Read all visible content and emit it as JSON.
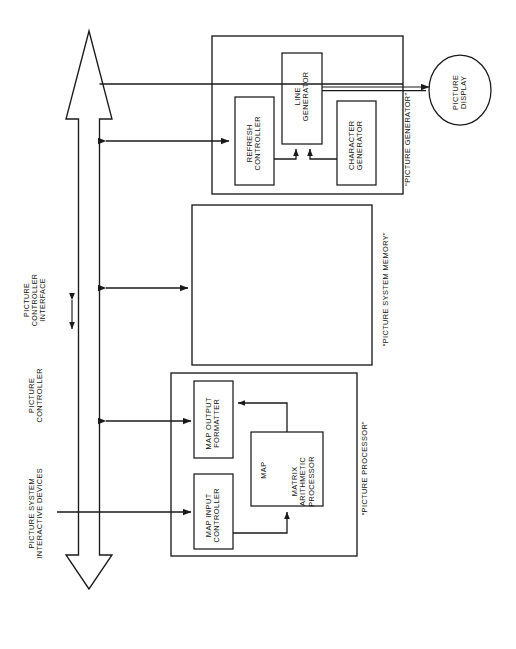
{
  "diagram": {
    "type": "block-diagram",
    "orientation": "rotated-90-ccw",
    "line_color": "#1a1a1a",
    "background": "#ffffff"
  },
  "side_labels": {
    "interactive_devices": "PICTURE SYSTEM\nINTERACTIVE DEVICES",
    "picture_controller": "PICTURE\nCONTROLLER",
    "controller_interface": "PICTURE\nCONTROLLER\nINTERFACE"
  },
  "groups": {
    "picture_generator": "“PICTURE GENERATOR”",
    "picture_system_memory": "“PICTURE SYSTEM MEMORY”",
    "picture_processor": "“PICTURE PROCESSOR”"
  },
  "blocks": {
    "line_generator": "LINE\nGENERATOR",
    "refresh_controller": "REFRESH\nCONTROLLER",
    "character_generator": "CHARACTER\nGENERATOR",
    "picture_display": "PICTURE\nDISPLAY",
    "map_output_formatter": "MAP OUTPUT\nFORMATTER",
    "map_input_controller": "MAP INPUT\nCONTROLLER",
    "map_abbrev": "MAP",
    "matrix_arithmetic_processor": "MATRIX\nARITHMETIC\nPROCESSOR"
  }
}
